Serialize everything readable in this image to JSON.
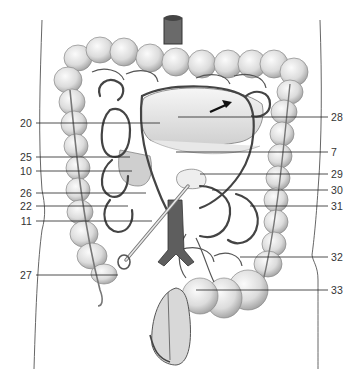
{
  "figure": {
    "type": "anatomical-illustration",
    "colors": {
      "background": "#ffffff",
      "ink": "#333333",
      "vessel": "#444444",
      "colon_fill": "#e6e6e6",
      "colon_shade": "#bdbdbd"
    }
  },
  "labels": {
    "left": [
      {
        "id": "20",
        "text": "20",
        "y": 123
      },
      {
        "id": "25",
        "text": "25",
        "y": 157
      },
      {
        "id": "10",
        "text": "10",
        "y": 171
      },
      {
        "id": "26",
        "text": "26",
        "y": 193
      },
      {
        "id": "22",
        "text": "22",
        "y": 206
      },
      {
        "id": "11",
        "text": "11",
        "y": 221
      },
      {
        "id": "27",
        "text": "27",
        "y": 275
      }
    ],
    "right": [
      {
        "id": "28",
        "text": "28",
        "y": 117
      },
      {
        "id": "7",
        "text": "7",
        "y": 152
      },
      {
        "id": "29",
        "text": "29",
        "y": 174
      },
      {
        "id": "30",
        "text": "30",
        "y": 190
      },
      {
        "id": "31",
        "text": "31",
        "y": 206
      },
      {
        "id": "32",
        "text": "32",
        "y": 257
      },
      {
        "id": "33",
        "text": "33",
        "y": 290
      }
    ]
  },
  "icons": {
    "arrow": "direction-arrow-icon",
    "forceps": "forceps-icon"
  }
}
